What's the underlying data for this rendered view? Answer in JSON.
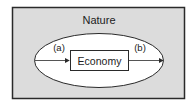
{
  "diagram": {
    "outer_label": "Nature",
    "inner_label": "Economy",
    "arrow_in_label": "(a)",
    "arrow_out_label": "(b)",
    "colors": {
      "nature_fill": "#dcdcdc",
      "ellipse_fill": "#ffffff",
      "stroke": "#2a2a2a"
    }
  }
}
